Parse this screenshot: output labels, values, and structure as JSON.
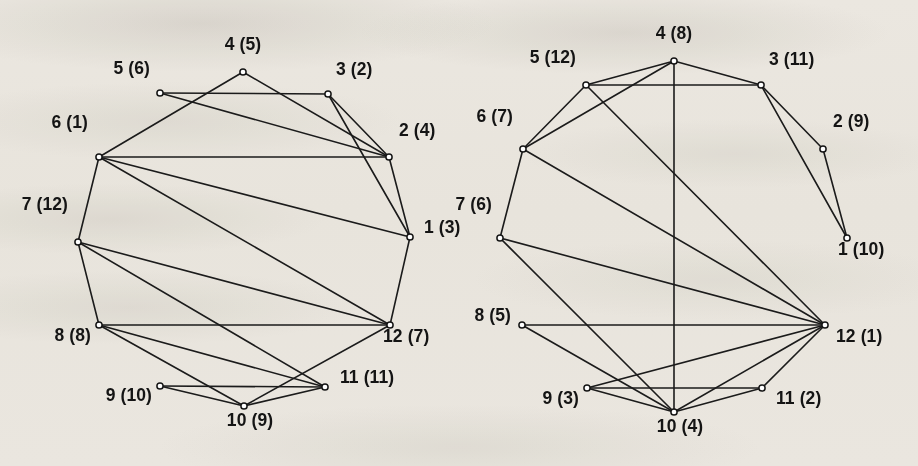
{
  "figure": {
    "background_color": "#f4f2ee",
    "ink_color": "#1b1b1b",
    "node_fill_color": "#ffffff",
    "width": 918,
    "height": 466
  },
  "graphs": [
    {
      "id": "left-graph",
      "name": "left-graph",
      "nodes": [
        {
          "id": "L1",
          "label": "1 (3)",
          "number": 1,
          "paren": 3,
          "x": 410,
          "y": 237,
          "label_x": 424,
          "label_y": 228,
          "label_anchor": "left"
        },
        {
          "id": "L2",
          "label": "2 (4)",
          "number": 2,
          "paren": 4,
          "x": 389,
          "y": 157,
          "label_x": 399,
          "label_y": 131,
          "label_anchor": "left"
        },
        {
          "id": "L3",
          "label": "3 (2)",
          "number": 3,
          "paren": 2,
          "x": 328,
          "y": 94,
          "label_x": 336,
          "label_y": 70,
          "label_anchor": "left"
        },
        {
          "id": "L4",
          "label": "4 (5)",
          "number": 4,
          "paren": 5,
          "x": 243,
          "y": 72,
          "label_x": 243,
          "label_y": 45,
          "label_anchor": "center"
        },
        {
          "id": "L5",
          "label": "5 (6)",
          "number": 5,
          "paren": 6,
          "x": 160,
          "y": 93,
          "label_x": 150,
          "label_y": 69,
          "label_anchor": "right"
        },
        {
          "id": "L6",
          "label": "6 (1)",
          "number": 6,
          "paren": 1,
          "x": 99,
          "y": 157,
          "label_x": 88,
          "label_y": 123,
          "label_anchor": "right"
        },
        {
          "id": "L7",
          "label": "7 (12)",
          "number": 7,
          "paren": 12,
          "x": 78,
          "y": 242,
          "label_x": 68,
          "label_y": 205,
          "label_anchor": "right"
        },
        {
          "id": "L8",
          "label": "8 (8)",
          "number": 8,
          "paren": 8,
          "x": 99,
          "y": 325,
          "label_x": 91,
          "label_y": 336,
          "label_anchor": "right"
        },
        {
          "id": "L9",
          "label": "9 (10)",
          "number": 9,
          "paren": 10,
          "x": 160,
          "y": 386,
          "label_x": 152,
          "label_y": 396,
          "label_anchor": "right"
        },
        {
          "id": "L10",
          "label": "10 (9)",
          "number": 10,
          "paren": 9,
          "x": 244,
          "y": 406,
          "label_x": 250,
          "label_y": 421,
          "label_anchor": "center"
        },
        {
          "id": "L11",
          "label": "11 (11)",
          "number": 11,
          "paren": 11,
          "x": 325,
          "y": 387,
          "label_x": 340,
          "label_y": 378,
          "label_anchor": "left"
        },
        {
          "id": "L12",
          "label": "12 (7)",
          "number": 12,
          "paren": 7,
          "x": 390,
          "y": 325,
          "label_x": 383,
          "label_y": 337,
          "label_anchor": "left"
        }
      ],
      "edges": [
        [
          "L1",
          "L2"
        ],
        [
          "L1",
          "L3"
        ],
        [
          "L1",
          "L6"
        ],
        [
          "L1",
          "L12"
        ],
        [
          "L2",
          "L3"
        ],
        [
          "L2",
          "L4"
        ],
        [
          "L2",
          "L6"
        ],
        [
          "L3",
          "L5"
        ],
        [
          "L4",
          "L6"
        ],
        [
          "L5",
          "L2"
        ],
        [
          "L6",
          "L7"
        ],
        [
          "L6",
          "L12"
        ],
        [
          "L7",
          "L8"
        ],
        [
          "L7",
          "L11"
        ],
        [
          "L7",
          "L12"
        ],
        [
          "L8",
          "L12"
        ],
        [
          "L8",
          "L10"
        ],
        [
          "L8",
          "L11"
        ],
        [
          "L9",
          "L11"
        ],
        [
          "L9",
          "L10"
        ],
        [
          "L10",
          "L11"
        ],
        [
          "L10",
          "L12"
        ]
      ]
    },
    {
      "id": "right-graph",
      "name": "right-graph",
      "nodes": [
        {
          "id": "R1",
          "label": "1 (10)",
          "number": 1,
          "paren": 10,
          "x": 847,
          "y": 238,
          "label_x": 838,
          "label_y": 250,
          "label_anchor": "left"
        },
        {
          "id": "R2",
          "label": "2 (9)",
          "number": 2,
          "paren": 9,
          "x": 823,
          "y": 149,
          "label_x": 833,
          "label_y": 122,
          "label_anchor": "left"
        },
        {
          "id": "R3",
          "label": "3 (11)",
          "number": 3,
          "paren": 11,
          "x": 761,
          "y": 85,
          "label_x": 769,
          "label_y": 60,
          "label_anchor": "left"
        },
        {
          "id": "R4",
          "label": "4 (8)",
          "number": 4,
          "paren": 8,
          "x": 674,
          "y": 61,
          "label_x": 674,
          "label_y": 34,
          "label_anchor": "center"
        },
        {
          "id": "R5",
          "label": "5 (12)",
          "number": 5,
          "paren": 12,
          "x": 586,
          "y": 85,
          "label_x": 576,
          "label_y": 58,
          "label_anchor": "right"
        },
        {
          "id": "R6",
          "label": "6 (7)",
          "number": 6,
          "paren": 7,
          "x": 523,
          "y": 149,
          "label_x": 513,
          "label_y": 117,
          "label_anchor": "right"
        },
        {
          "id": "R7",
          "label": "7 (6)",
          "number": 7,
          "paren": 6,
          "x": 500,
          "y": 238,
          "label_x": 492,
          "label_y": 205,
          "label_anchor": "right"
        },
        {
          "id": "R8",
          "label": "8 (5)",
          "number": 8,
          "paren": 5,
          "x": 522,
          "y": 325,
          "label_x": 511,
          "label_y": 316,
          "label_anchor": "right"
        },
        {
          "id": "R9",
          "label": "9 (3)",
          "number": 9,
          "paren": 3,
          "x": 587,
          "y": 388,
          "label_x": 579,
          "label_y": 399,
          "label_anchor": "right"
        },
        {
          "id": "R10",
          "label": "10 (4)",
          "number": 10,
          "paren": 4,
          "x": 674,
          "y": 412,
          "label_x": 680,
          "label_y": 427,
          "label_anchor": "center"
        },
        {
          "id": "R11",
          "label": "11 (2)",
          "number": 11,
          "paren": 2,
          "x": 762,
          "y": 388,
          "label_x": 776,
          "label_y": 399,
          "label_anchor": "left"
        },
        {
          "id": "R12",
          "label": "12 (1)",
          "number": 12,
          "paren": 1,
          "x": 825,
          "y": 325,
          "label_x": 836,
          "label_y": 337,
          "label_anchor": "left"
        }
      ],
      "edges": [
        [
          "R1",
          "R2"
        ],
        [
          "R1",
          "R3"
        ],
        [
          "R2",
          "R3"
        ],
        [
          "R3",
          "R4"
        ],
        [
          "R3",
          "R5"
        ],
        [
          "R4",
          "R5"
        ],
        [
          "R4",
          "R6"
        ],
        [
          "R4",
          "R10"
        ],
        [
          "R5",
          "R6"
        ],
        [
          "R5",
          "R12"
        ],
        [
          "R6",
          "R7"
        ],
        [
          "R6",
          "R12"
        ],
        [
          "R7",
          "R10"
        ],
        [
          "R7",
          "R12"
        ],
        [
          "R8",
          "R12"
        ],
        [
          "R8",
          "R10"
        ],
        [
          "R9",
          "R11"
        ],
        [
          "R9",
          "R10"
        ],
        [
          "R9",
          "R12"
        ],
        [
          "R10",
          "R11"
        ],
        [
          "R10",
          "R12"
        ],
        [
          "R11",
          "R12"
        ]
      ]
    }
  ],
  "chart_data": {
    "type": "diagram",
    "title": "",
    "panels": [
      {
        "name": "left-graph",
        "vertex_labels": [
          "1 (3)",
          "2 (4)",
          "3 (2)",
          "4 (5)",
          "5 (6)",
          "6 (1)",
          "7 (12)",
          "8 (8)",
          "9 (10)",
          "10 (9)",
          "11 (11)",
          "12 (7)"
        ],
        "edge_count": 22,
        "edge_list": [
          "1-2",
          "1-3",
          "1-6",
          "1-12",
          "2-3",
          "2-4",
          "2-5",
          "2-6",
          "3-5",
          "4-6",
          "6-7",
          "6-12",
          "7-8",
          "7-11",
          "7-12",
          "8-10",
          "8-11",
          "8-12",
          "9-10",
          "9-11",
          "10-11",
          "10-12"
        ]
      },
      {
        "name": "right-graph",
        "vertex_labels": [
          "1 (10)",
          "2 (9)",
          "3 (11)",
          "4 (8)",
          "5 (12)",
          "6 (7)",
          "7 (6)",
          "8 (5)",
          "9 (3)",
          "10 (4)",
          "11 (2)",
          "12 (1)"
        ],
        "edge_count": 22,
        "edge_list": [
          "1-2",
          "1-3",
          "2-3",
          "3-4",
          "3-5",
          "4-5",
          "4-6",
          "4-10",
          "5-6",
          "5-12",
          "6-7",
          "6-12",
          "7-10",
          "7-12",
          "8-10",
          "8-12",
          "9-10",
          "9-11",
          "9-12",
          "10-11",
          "10-12",
          "11-12"
        ]
      }
    ]
  }
}
